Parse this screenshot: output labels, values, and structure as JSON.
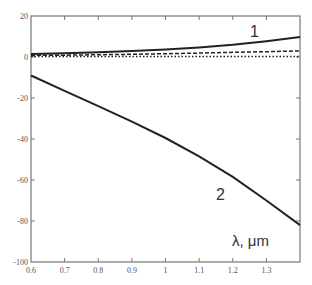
{
  "chart_data": {
    "type": "line",
    "title": "",
    "xlabel": "λ, μm",
    "ylabel": "",
    "xlim": [
      0.6,
      1.4
    ],
    "ylim": [
      -100,
      20
    ],
    "x_ticks": [
      "0.6",
      "0.7",
      "0.8",
      "0.9",
      "1",
      "1.1",
      "1.2",
      "1.3"
    ],
    "y_ticks": [
      "20",
      "0",
      "-20",
      "-40",
      "-60",
      "-80",
      "-100"
    ],
    "grid": false,
    "legend": null,
    "annotations": [
      "1",
      "2"
    ],
    "x": [
      0.6,
      0.7,
      0.8,
      0.9,
      1.0,
      1.1,
      1.2,
      1.3,
      1.4
    ],
    "series": [
      {
        "name": "1 (solid)",
        "style": "solid",
        "values": [
          1.5,
          1.8,
          2.3,
          2.9,
          3.7,
          4.7,
          6.0,
          7.7,
          9.7
        ]
      },
      {
        "name": "dashed",
        "style": "dashed",
        "values": [
          0.8,
          0.9,
          1.1,
          1.3,
          1.6,
          1.9,
          2.3,
          2.6,
          3.0
        ]
      },
      {
        "name": "dotted",
        "style": "dotted",
        "values": [
          0.2,
          0.2,
          0.2,
          0.2,
          0.2,
          0.2,
          0.2,
          0.2,
          0.2
        ]
      },
      {
        "name": "2 (solid, overlapped by dotted)",
        "style": "solid",
        "values": [
          -9,
          -16.5,
          -24,
          -31.5,
          -39.5,
          -48.5,
          -58.5,
          -70,
          -82
        ]
      }
    ]
  },
  "labels": {
    "curve1": "1",
    "curve2": "2",
    "xaxis": "λ, μm"
  }
}
